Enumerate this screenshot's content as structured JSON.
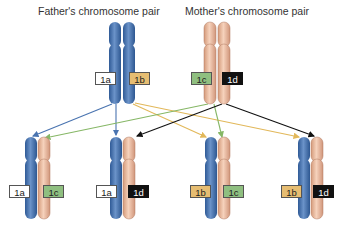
{
  "titles": {
    "father": "Father's chromosome pair",
    "mother": "Mother's chromosome pair"
  },
  "colors": {
    "father_chromosome": "#4a74b0",
    "mother_chromosome": "#e8b89a",
    "label_1a": "#ffffff",
    "label_1b": "#e6bd72",
    "label_1c": "#8fbf80",
    "label_1d": "#111111",
    "arrow_1a": "#4a74b0",
    "arrow_1b": "#e8c060",
    "arrow_1c": "#8fbf6a",
    "arrow_1d": "#111111"
  },
  "parents": {
    "father": {
      "labels": [
        "1a",
        "1b"
      ]
    },
    "mother": {
      "labels": [
        "1c",
        "1d"
      ]
    }
  },
  "offspring": [
    {
      "labels": [
        "1a",
        "1c"
      ]
    },
    {
      "labels": [
        "1a",
        "1d"
      ]
    },
    {
      "labels": [
        "1b",
        "1c"
      ]
    },
    {
      "labels": [
        "1b",
        "1d"
      ]
    }
  ]
}
